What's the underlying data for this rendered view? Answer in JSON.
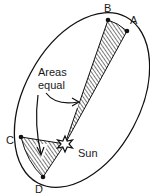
{
  "diagram": {
    "points": [
      {
        "id": "A",
        "label": "A",
        "x": 127,
        "y": 31,
        "lx": 130,
        "ly": 24
      },
      {
        "id": "B",
        "label": "B",
        "x": 108,
        "y": 20,
        "lx": 105,
        "ly": 10
      },
      {
        "id": "C",
        "label": "C",
        "x": 21,
        "y": 137,
        "lx": 6,
        "ly": 144
      },
      {
        "id": "D",
        "label": "D",
        "x": 43,
        "y": 177,
        "lx": 35,
        "ly": 193
      }
    ],
    "sun": {
      "label": "Sun",
      "x": 65,
      "y": 144
    },
    "annotation": {
      "line1": "Areas",
      "line2": "equal"
    },
    "colors": {
      "stroke": "#111111",
      "hatch": "#222222",
      "background": "#ffffff"
    }
  }
}
